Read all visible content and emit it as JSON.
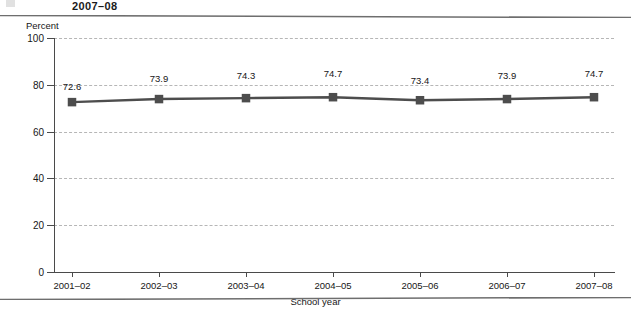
{
  "page": {
    "running_head": "2007–08",
    "folio": "",
    "rule_color": "#6e6e6e"
  },
  "chart_data": {
    "type": "line",
    "title": "",
    "xlabel": "School year",
    "ylabel": "Percent",
    "categories": [
      "2001–02",
      "2002–03",
      "2003–04",
      "2004–05",
      "2005–06",
      "2006–07",
      "2007–08"
    ],
    "values": [
      72.6,
      73.9,
      74.3,
      74.7,
      73.4,
      73.9,
      74.7
    ],
    "point_labels": [
      "72.6",
      "73.9",
      "74.3",
      "74.7",
      "73.4",
      "73.9",
      "74.7"
    ],
    "ylim": [
      0,
      100
    ],
    "yticks": [
      0,
      20,
      40,
      60,
      80,
      100
    ],
    "ytick_labels": [
      "0",
      "20",
      "40",
      "60",
      "80",
      "100"
    ],
    "grid": true,
    "grid_style": "dashed",
    "grid_color": "#b6b6b6",
    "legend": "none",
    "series_color": "#4d4d4d",
    "marker": "square",
    "marker_color": "#4d4d4d",
    "axis_color": "#4a4a4a"
  }
}
